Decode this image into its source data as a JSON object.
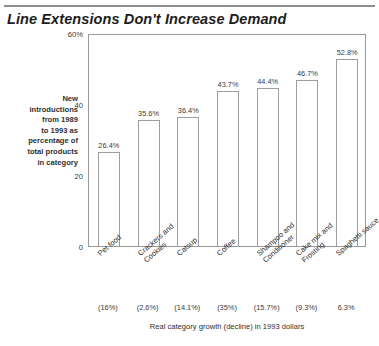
{
  "chart_data": {
    "type": "bar",
    "title": "Line Extensions Don't Increase Demand",
    "ylabel": "New introductions from 1989 to 1993 as percentage of total products in category",
    "xlabel": "Real category growth (decline) in 1993 dollars",
    "ylim": [
      0,
      60
    ],
    "grid": false,
    "legend": "none",
    "y_ticks": [
      {
        "value": 60,
        "label": "60%"
      },
      {
        "value": 40,
        "label": "40"
      },
      {
        "value": 20,
        "label": "20"
      },
      {
        "value": 0,
        "label": "0"
      }
    ],
    "categories": [
      "Pet food",
      "Crackers and Cookies",
      "Catsup",
      "Coffee",
      "Shampoo and Conditioner",
      "Cake mix and Frosting",
      "Spaghetti sauce"
    ],
    "category_lines": [
      [
        "Pet food"
      ],
      [
        "Crackers and",
        "Cookies"
      ],
      [
        "Catsup"
      ],
      [
        "Coffee"
      ],
      [
        "Shampoo and",
        "Conditioner"
      ],
      [
        "Cake mix and",
        "Frosting"
      ],
      [
        "Spaghetti sauce"
      ]
    ],
    "values": [
      26.4,
      35.6,
      36.4,
      43.7,
      44.4,
      46.7,
      52.8
    ],
    "value_labels": [
      "26.4%",
      "35.6%",
      "36.4%",
      "43.7%",
      "44.4%",
      "46.7%",
      "52.8%"
    ],
    "secondary_axis": {
      "name": "Real category growth (decline) in 1993 dollars",
      "labels": [
        "(16%)",
        "(2.6%)",
        "(14.1%)",
        "(35%)",
        "(15.7%)",
        "(9.3%)",
        "6.3%"
      ],
      "values": [
        -16.0,
        -2.6,
        -14.1,
        -35.0,
        -15.7,
        -9.3,
        6.3
      ]
    },
    "colors": {
      "bar_fill": "#ffffff",
      "bar_outline": "#9d9d9d",
      "frame": "#9a9a9a",
      "text": "#303030",
      "rule": "#8d8d8d"
    }
  },
  "caption_lines": [
    "New",
    "introductions",
    "from 1989",
    "to 1993 as",
    "percentage of",
    "total products",
    "in category"
  ],
  "source_stub": ""
}
